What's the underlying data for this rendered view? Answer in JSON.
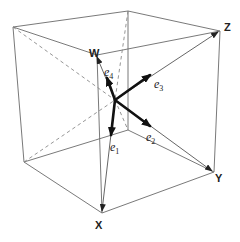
{
  "figure": {
    "vertex_labels": {
      "W": "W",
      "X": "X",
      "Y": "Y",
      "Z": "Z"
    },
    "basis_vectors": [
      {
        "name": "e",
        "sub": "1",
        "target": "X"
      },
      {
        "name": "e",
        "sub": "2",
        "target": "Y"
      },
      {
        "name": "e",
        "sub": "3",
        "target": "Z"
      },
      {
        "name": "e",
        "sub": "4",
        "target": "W"
      }
    ],
    "colors": {
      "edge": "#6a6a6a",
      "basis": "#111111",
      "background": "#ffffff"
    }
  }
}
